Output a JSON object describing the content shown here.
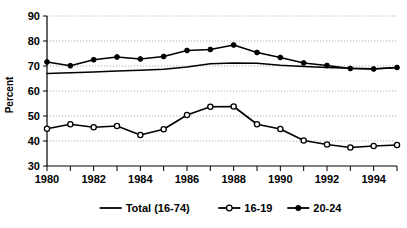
{
  "chart_data": {
    "type": "line",
    "title": "",
    "xlabel": "",
    "ylabel": "Percent",
    "x": [
      1980,
      1981,
      1982,
      1983,
      1984,
      1985,
      1986,
      1987,
      1988,
      1989,
      1990,
      1991,
      1992,
      1993,
      1994,
      1995
    ],
    "xlim": [
      1980,
      1995
    ],
    "ylim": [
      30,
      90
    ],
    "y_ticks": [
      30,
      40,
      50,
      60,
      70,
      80,
      90
    ],
    "x_tick_labels": [
      "1980",
      "",
      "1982",
      "",
      "1984",
      "",
      "1986",
      "",
      "1988",
      "",
      "1990",
      "",
      "1992",
      "",
      "1994",
      ""
    ],
    "x_major_labels": [
      "1980",
      "1982",
      "1984",
      "1986",
      "1988",
      "1990",
      "1992",
      "1994"
    ],
    "grid": "horizontal-dotted",
    "legend_position": "bottom",
    "series": [
      {
        "name": "Total (16-74)",
        "marker": "none",
        "values": [
          67.0,
          67.3,
          67.6,
          68.0,
          68.3,
          68.7,
          69.6,
          70.9,
          71.2,
          71.1,
          70.3,
          69.8,
          69.4,
          69.1,
          68.9,
          69.3
        ]
      },
      {
        "name": "16-19",
        "marker": "open-circle",
        "values": [
          44.9,
          46.7,
          45.5,
          46.0,
          42.4,
          44.7,
          50.4,
          53.7,
          53.8,
          46.7,
          44.8,
          40.2,
          38.6,
          37.4,
          38.0,
          38.4
        ]
      },
      {
        "name": "20-24",
        "marker": "filled-circle",
        "values": [
          71.6,
          70.1,
          72.5,
          73.6,
          72.8,
          73.8,
          76.2,
          76.6,
          78.4,
          75.4,
          73.4,
          71.2,
          70.2,
          69.0,
          68.8,
          69.4
        ]
      }
    ]
  },
  "axis": {
    "y_title": "Percent"
  },
  "legend": {
    "items": [
      {
        "label": "Total (16-74)",
        "marker": "line"
      },
      {
        "label": "16-19",
        "marker": "open-circle"
      },
      {
        "label": "20-24",
        "marker": "filled-circle"
      }
    ]
  }
}
